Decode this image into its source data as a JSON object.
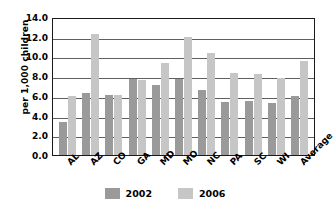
{
  "chart_data": {
    "type": "bar",
    "title": "",
    "xlabel": "",
    "ylabel": "per 1,000 children",
    "ylim": [
      0.0,
      14.0
    ],
    "ytick_step": 2.0,
    "ytick_labels": [
      "14.0",
      "12.0",
      "10.0",
      "8.0",
      "6.0",
      "4.0",
      "2.0",
      "0.0"
    ],
    "ytick_values": [
      14.0,
      12.0,
      10.0,
      8.0,
      6.0,
      4.0,
      2.0,
      0.0
    ],
    "grid": true,
    "grid_axis": "y",
    "legend_position": "bottom",
    "categories": [
      "AL",
      "AZ",
      "CO",
      "GA",
      "MD",
      "MO",
      "NC",
      "PA",
      "SC",
      "WI",
      "Average"
    ],
    "series": [
      {
        "name": "2002",
        "color": "#9a9a9a",
        "values": [
          3.3,
          6.3,
          6.1,
          7.7,
          7.1,
          7.7,
          6.6,
          5.4,
          5.5,
          5.3,
          6.0
        ]
      },
      {
        "name": "2006",
        "color": "#c6c6c6",
        "values": [
          6.0,
          12.3,
          6.1,
          7.6,
          9.3,
          12.0,
          10.4,
          8.3,
          8.2,
          7.8,
          9.5
        ]
      }
    ]
  },
  "legend": {
    "items": [
      {
        "label": "2002",
        "swatch": "legend-swatch-2002"
      },
      {
        "label": "2006",
        "swatch": "legend-swatch-2006"
      }
    ]
  },
  "colors": {
    "series_2002": "#9a9a9a",
    "series_2006": "#c6c6c6",
    "axis": "#1a1a1a",
    "gridline": "#5f5f5f",
    "background": "#ffffff"
  }
}
